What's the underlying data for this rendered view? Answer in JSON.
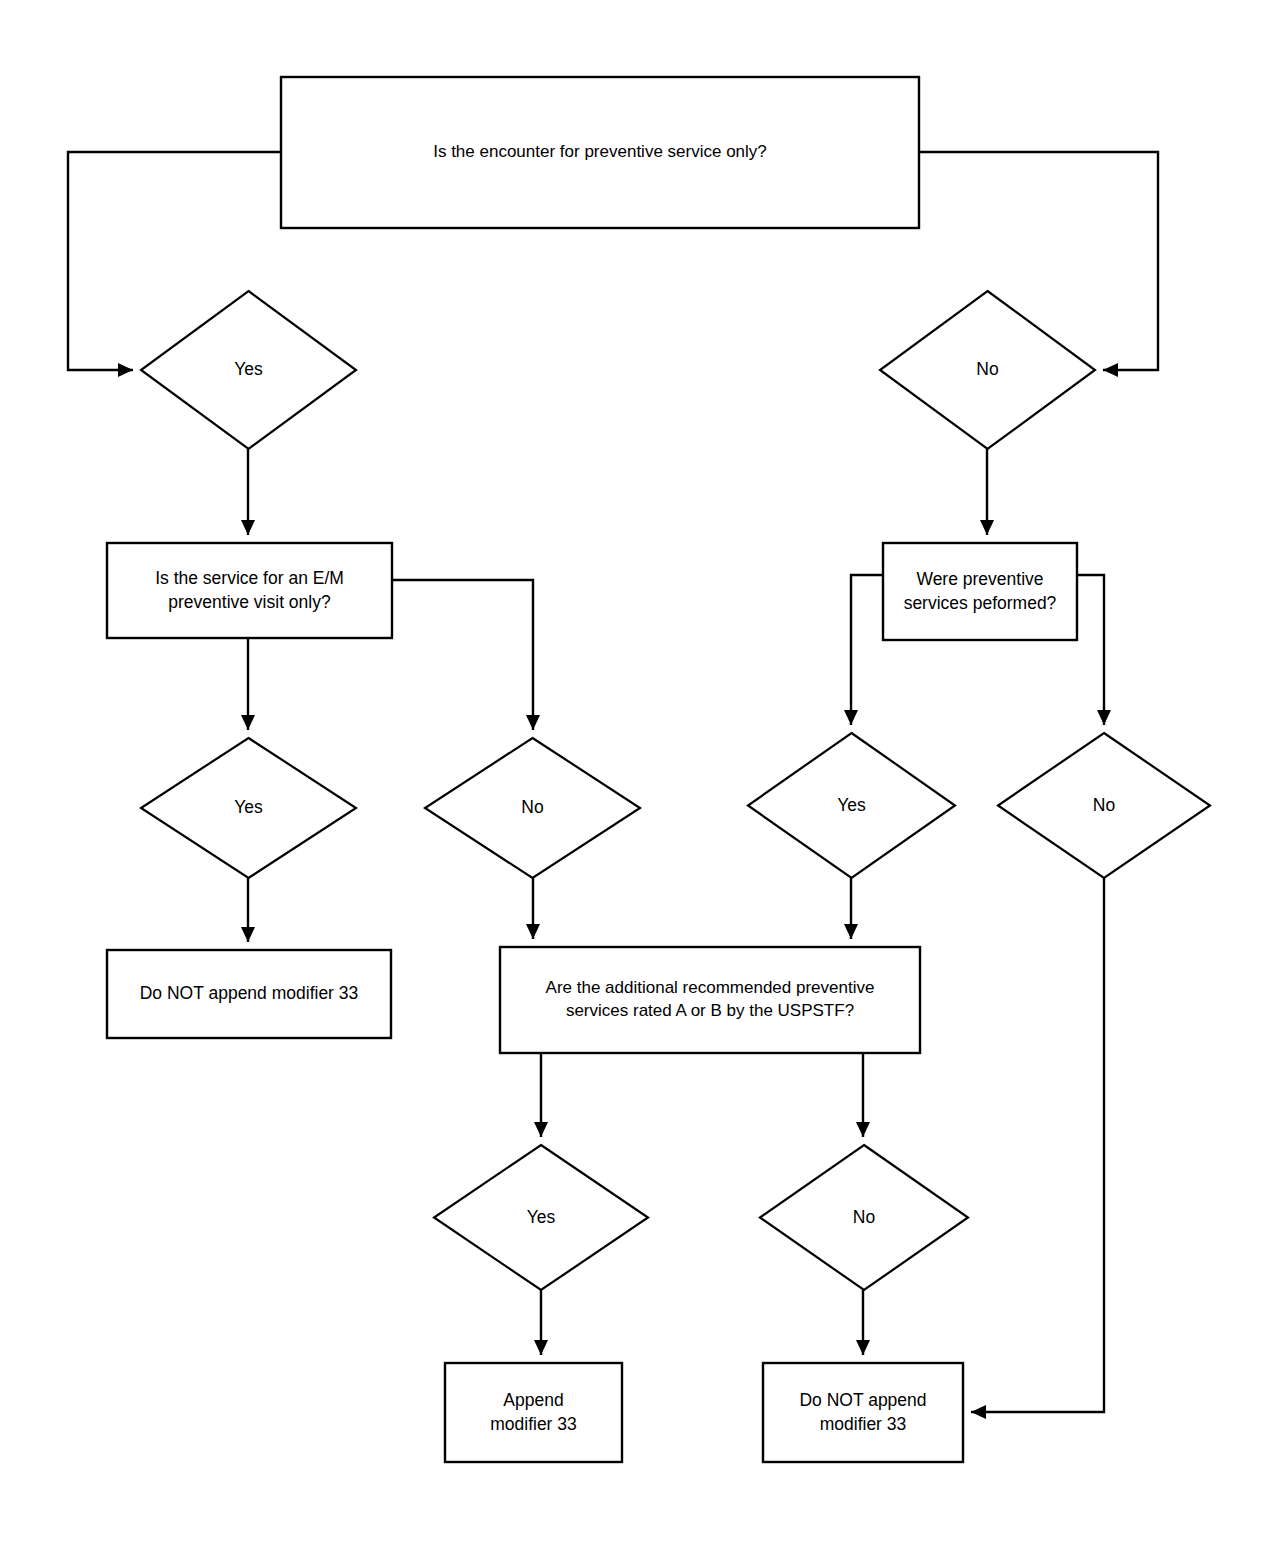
{
  "diagram": {
    "stroke_color": "#000000",
    "fill_color": "#ffffff",
    "background_color": "#ffffff"
  },
  "nodes": {
    "q_encounter_preventive": {
      "type": "process-box",
      "text": "Is the encounter for preventive service only?",
      "x": 281,
      "y": 77,
      "w": 638,
      "h": 151
    },
    "yes_encounter": {
      "type": "decision-diamond",
      "text": "Yes",
      "x": 141,
      "y": 291,
      "w": 215,
      "h": 158
    },
    "no_encounter": {
      "type": "decision-diamond",
      "text": "No",
      "x": 880,
      "y": 291,
      "w": 215,
      "h": 158
    },
    "q_em_preventive_visit": {
      "type": "process-box",
      "text": "Is the service for an E/M\npreventive visit only?",
      "x": 107,
      "y": 543,
      "w": 285,
      "h": 95
    },
    "q_preventive_services_performed": {
      "type": "process-box",
      "text": "Were preventive\nservices peformed?",
      "x": 883,
      "y": 543,
      "w": 194,
      "h": 97
    },
    "yes_em": {
      "type": "decision-diamond",
      "text": "Yes",
      "x": 141,
      "y": 738,
      "w": 215,
      "h": 140
    },
    "no_em": {
      "type": "decision-diamond",
      "text": "No",
      "x": 425,
      "y": 738,
      "w": 215,
      "h": 140
    },
    "yes_services": {
      "type": "decision-diamond",
      "text": "Yes",
      "x": 748,
      "y": 733,
      "w": 207,
      "h": 145
    },
    "no_services": {
      "type": "decision-diamond",
      "text": "No",
      "x": 998,
      "y": 733,
      "w": 212,
      "h": 145
    },
    "do_not_append_left": {
      "type": "terminal-box",
      "text": "Do NOT append modifier 33",
      "x": 107,
      "y": 950,
      "w": 284,
      "h": 88
    },
    "q_uspstf_rated": {
      "type": "process-box",
      "text": "Are the additional recommended preventive\nservices rated A or B by the USPSTF?",
      "x": 500,
      "y": 947,
      "w": 420,
      "h": 106
    },
    "yes_uspstf": {
      "type": "decision-diamond",
      "text": "Yes",
      "x": 434,
      "y": 1145,
      "w": 214,
      "h": 145
    },
    "no_uspstf": {
      "type": "decision-diamond",
      "text": "No",
      "x": 760,
      "y": 1145,
      "w": 208,
      "h": 145
    },
    "append_modifier": {
      "type": "terminal-box",
      "text": "Append\nmodifier 33",
      "x": 445,
      "y": 1363,
      "w": 177,
      "h": 99
    },
    "do_not_append_bottom": {
      "type": "terminal-box",
      "text": "Do NOT append\nmodifier 33",
      "x": 763,
      "y": 1363,
      "w": 200,
      "h": 99
    }
  },
  "edges": [
    {
      "name": "encounter-to-yes",
      "path": "M 281 152 L 68 152 L 68 370 L 133 370",
      "arrow": "right"
    },
    {
      "name": "encounter-to-no",
      "path": "M 919 152 L 1158 152 L 1158 370 L 1103 370",
      "arrow": "left"
    },
    {
      "name": "yes-to-em-question",
      "path": "M 248 449 L 248 535",
      "arrow": "down"
    },
    {
      "name": "no-to-services-question",
      "path": "M 987 449 L 987 535",
      "arrow": "down"
    },
    {
      "name": "em-to-yes",
      "path": "M 248 638 L 248 730",
      "arrow": "down"
    },
    {
      "name": "em-to-no",
      "path": "M 392 580 L 533 580 L 533 730",
      "arrow": "down"
    },
    {
      "name": "services-to-yes",
      "path": "M 883 575 L 851 575 L 851 725",
      "arrow": "down"
    },
    {
      "name": "services-to-no",
      "path": "M 1077 575 L 1104 575 L 1104 725",
      "arrow": "down"
    },
    {
      "name": "yes-em-to-donot",
      "path": "M 248 878 L 248 942",
      "arrow": "down"
    },
    {
      "name": "no-em-to-uspstf",
      "path": "M 533 878 L 533 939",
      "arrow": "down"
    },
    {
      "name": "yes-services-to-uspstf",
      "path": "M 851 878 L 851 939",
      "arrow": "down"
    },
    {
      "name": "uspstf-to-yes",
      "path": "M 541 1053 L 541 1137",
      "arrow": "down"
    },
    {
      "name": "uspstf-to-no",
      "path": "M 863 1053 L 863 1137",
      "arrow": "down"
    },
    {
      "name": "yes-uspstf-to-append",
      "path": "M 541 1290 L 541 1355",
      "arrow": "down"
    },
    {
      "name": "no-uspstf-to-donot",
      "path": "M 863 1290 L 863 1355",
      "arrow": "down"
    },
    {
      "name": "no-services-to-donot",
      "path": "M 1104 878 L 1104 1412 L 971 1412",
      "arrow": "left"
    }
  ]
}
